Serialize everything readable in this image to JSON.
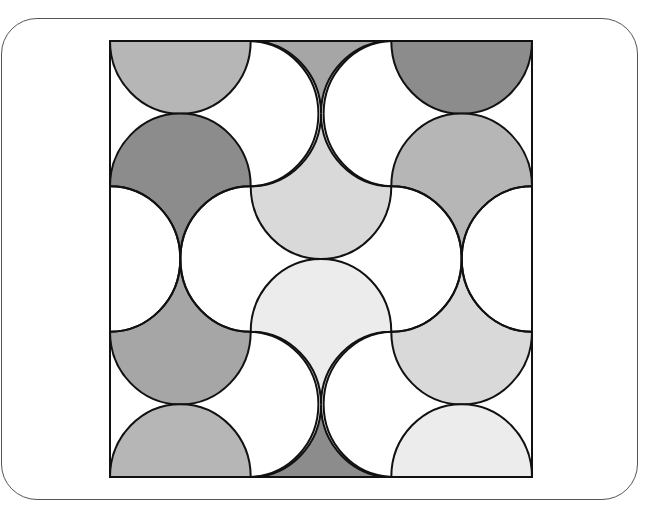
{
  "figure": {
    "square": {
      "x0": 110,
      "y0": 41,
      "x1": 532,
      "y1": 477
    },
    "colors": {
      "outline": "#111111",
      "white": "#ffffff",
      "dark": "#8c8c8c",
      "medium_dark": "#a6a6a6",
      "medium": "#b6b6b6",
      "light": "#d9d9d9",
      "very_light": "#ececec"
    },
    "shapes": [
      {
        "name": "top-left-half-disc",
        "fill": "medium"
      },
      {
        "name": "top-middle-cusp",
        "fill": "medium_dark"
      },
      {
        "name": "top-right-half-disc",
        "fill": "dark"
      },
      {
        "name": "left-upper-scale",
        "fill": "dark"
      },
      {
        "name": "center-upper-scale",
        "fill": "light"
      },
      {
        "name": "right-upper-scale",
        "fill": "medium"
      },
      {
        "name": "center-lower-scale",
        "fill": "very_light"
      },
      {
        "name": "left-lower-scale",
        "fill": "medium_dark"
      },
      {
        "name": "right-lower-scale",
        "fill": "light"
      },
      {
        "name": "bottom-left-half-disc",
        "fill": "medium"
      },
      {
        "name": "bottom-middle-cusp",
        "fill": "dark"
      },
      {
        "name": "bottom-right-half-disc",
        "fill": "very_light"
      }
    ]
  }
}
